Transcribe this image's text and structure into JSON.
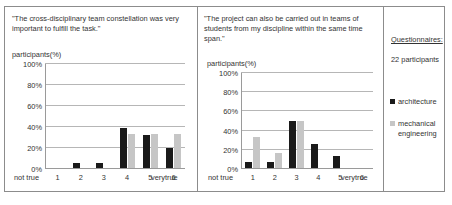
{
  "figure": {
    "sidebar": {
      "heading": "Questionnaires:",
      "subtitle": "22 participants",
      "legend": [
        {
          "label": "architecture",
          "color": "#1a1a1a",
          "key": "arch"
        },
        {
          "label": "mechanical engineering",
          "color": "#c6c6c6",
          "key": "mech"
        }
      ]
    }
  },
  "chart_data": [
    {
      "type": "bar",
      "title": "\"The cross-disciplinary team constellation was very important to fulfill the task.\"",
      "ylabel": "participants(%)",
      "xlabel": "",
      "categories": [
        "1",
        "2",
        "3",
        "4",
        "5",
        "6"
      ],
      "x_axis_left_caption": "not true",
      "x_axis_right_caption": "verytrue",
      "ylim": [
        0,
        100
      ],
      "yticks": [
        "0%",
        "20%",
        "40%",
        "60%",
        "80%",
        "100%"
      ],
      "ytick_values": [
        0,
        20,
        40,
        60,
        80,
        100
      ],
      "grid": true,
      "legend_position": "outside-right",
      "series": [
        {
          "name": "architecture",
          "color": "#1a1a1a",
          "values": [
            0,
            5,
            5,
            38,
            32,
            19
          ]
        },
        {
          "name": "mechanical engineering",
          "color": "#c6c6c6",
          "values": [
            0,
            0,
            0,
            33,
            33,
            33
          ]
        }
      ]
    },
    {
      "type": "bar",
      "title": "\"The project can also be carried out in teams of students from my discipline within the same time span.\"",
      "ylabel": "participants(%)",
      "xlabel": "",
      "categories": [
        "1",
        "2",
        "3",
        "4",
        "5",
        "6"
      ],
      "x_axis_left_caption": "not true",
      "x_axis_right_caption": "verytrue",
      "ylim": [
        0,
        100
      ],
      "yticks": [
        "0%",
        "20%",
        "40%",
        "60%",
        "80%",
        "100%"
      ],
      "ytick_values": [
        0,
        20,
        40,
        60,
        80,
        100
      ],
      "grid": true,
      "legend_position": "outside-right",
      "series": [
        {
          "name": "architecture",
          "color": "#1a1a1a",
          "values": [
            6,
            6,
            50,
            25,
            13,
            0
          ]
        },
        {
          "name": "mechanical engineering",
          "color": "#c6c6c6",
          "values": [
            33,
            16,
            50,
            0,
            0,
            0
          ]
        }
      ]
    }
  ]
}
